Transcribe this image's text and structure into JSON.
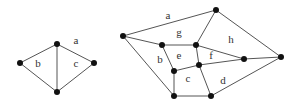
{
  "graphs": [
    {
      "name": "small-planar-graph",
      "nodes": [
        {
          "id": "top",
          "x": 57,
          "y": 44
        },
        {
          "id": "left",
          "x": 20,
          "y": 63
        },
        {
          "id": "right",
          "x": 94,
          "y": 63
        },
        {
          "id": "bottom",
          "x": 57,
          "y": 92
        }
      ],
      "edges": [
        [
          "top",
          "left"
        ],
        [
          "top",
          "right"
        ],
        [
          "top",
          "bottom"
        ],
        [
          "left",
          "bottom"
        ],
        [
          "right",
          "bottom"
        ]
      ],
      "face_labels": [
        {
          "text": "a",
          "x": 76,
          "y": 41
        },
        {
          "text": "b",
          "x": 38,
          "y": 64
        },
        {
          "text": "c",
          "x": 76,
          "y": 64
        }
      ]
    },
    {
      "name": "large-planar-graph",
      "nodes": [
        {
          "id": "A",
          "x": 123,
          "y": 36
        },
        {
          "id": "B",
          "x": 216,
          "y": 10
        },
        {
          "id": "C",
          "x": 281,
          "y": 57
        },
        {
          "id": "D",
          "x": 162,
          "y": 45
        },
        {
          "id": "E",
          "x": 196,
          "y": 45
        },
        {
          "id": "F",
          "x": 244,
          "y": 59
        },
        {
          "id": "G",
          "x": 174,
          "y": 71
        },
        {
          "id": "H",
          "x": 199,
          "y": 65
        },
        {
          "id": "I",
          "x": 174,
          "y": 96
        },
        {
          "id": "J",
          "x": 211,
          "y": 96
        }
      ],
      "edges": [
        [
          "A",
          "B"
        ],
        [
          "B",
          "C"
        ],
        [
          "A",
          "D"
        ],
        [
          "A",
          "I"
        ],
        [
          "D",
          "E"
        ],
        [
          "D",
          "G"
        ],
        [
          "E",
          "B"
        ],
        [
          "E",
          "H"
        ],
        [
          "E",
          "F"
        ],
        [
          "G",
          "H"
        ],
        [
          "G",
          "I"
        ],
        [
          "H",
          "F"
        ],
        [
          "H",
          "J"
        ],
        [
          "I",
          "J"
        ],
        [
          "J",
          "C"
        ],
        [
          "F",
          "C"
        ]
      ],
      "face_labels": [
        {
          "text": "a",
          "x": 168,
          "y": 16
        },
        {
          "text": "g",
          "x": 179,
          "y": 33
        },
        {
          "text": "h",
          "x": 231,
          "y": 40
        },
        {
          "text": "b",
          "x": 160,
          "y": 60
        },
        {
          "text": "e",
          "x": 179,
          "y": 56
        },
        {
          "text": "f",
          "x": 211,
          "y": 56
        },
        {
          "text": "c",
          "x": 188,
          "y": 79
        },
        {
          "text": "d",
          "x": 223,
          "y": 81
        }
      ]
    }
  ]
}
